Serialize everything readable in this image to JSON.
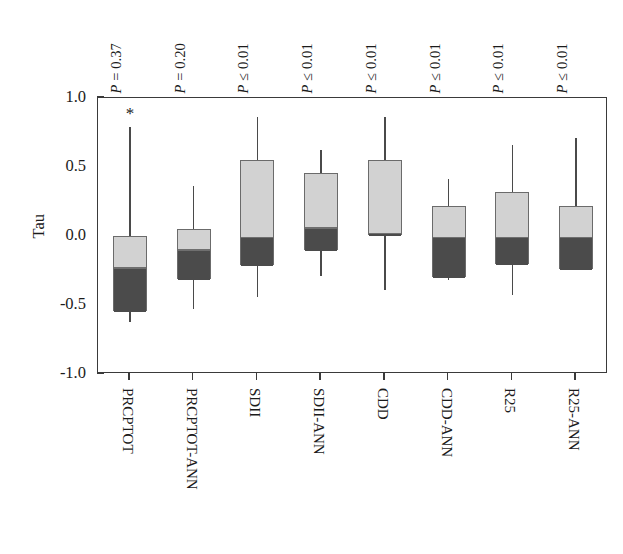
{
  "chart_data": {
    "type": "box",
    "title": "",
    "xlabel": "",
    "ylabel": "Tau",
    "ylim": [
      -1.0,
      1.0
    ],
    "yticks": [
      "1.0",
      "0.5",
      "0.0",
      "-0.5",
      "-1.0"
    ],
    "ytick_values": [
      1.0,
      0.5,
      0.0,
      -0.5,
      -1.0
    ],
    "grid": false,
    "legend": "none",
    "categories": [
      "PRCPTOT",
      "PRCPTOT-ANN",
      "SDII",
      "SDII-ANN",
      "CDD",
      "CDD-ANN",
      "R25",
      "R25-ANN"
    ],
    "annotations": {
      "p_values": [
        "P = 0.37",
        "P = 0.20",
        "P ≤ 0.01",
        "P ≤ 0.01",
        "P ≤ 0.01",
        "P ≤ 0.01",
        "P ≤ 0.01",
        "P ≤ 0.01"
      ],
      "outlier_marker": "*",
      "outlier_category": "PRCPTOT",
      "outlier_value": 0.89
    },
    "boxes": [
      {
        "category": "PRCPTOT",
        "whisker_low": -0.62,
        "q1": -0.54,
        "median": -0.22,
        "q3": 0.0,
        "whisker_high": 0.79
      },
      {
        "category": "PRCPTOT-ANN",
        "whisker_low": -0.53,
        "q1": -0.31,
        "median": -0.09,
        "q3": 0.05,
        "whisker_high": 0.36
      },
      {
        "category": "SDII",
        "whisker_low": -0.44,
        "q1": -0.21,
        "median": 0.0,
        "q3": 0.55,
        "whisker_high": 0.86
      },
      {
        "category": "SDII-ANN",
        "whisker_low": -0.29,
        "q1": -0.1,
        "median": 0.07,
        "q3": 0.46,
        "whisker_high": 0.62
      },
      {
        "category": "CDD",
        "whisker_low": -0.39,
        "q1": 0.01,
        "median": 0.03,
        "q3": 0.55,
        "whisker_high": 0.86
      },
      {
        "category": "CDD-ANN",
        "whisker_low": -0.32,
        "q1": -0.3,
        "median": 0.0,
        "q3": 0.22,
        "whisker_high": 0.41
      },
      {
        "category": "R25",
        "whisker_low": -0.43,
        "q1": -0.2,
        "median": 0.0,
        "q3": 0.32,
        "whisker_high": 0.66
      },
      {
        "category": "R25-ANN",
        "whisker_low": -0.17,
        "q1": -0.24,
        "median": 0.0,
        "q3": 0.22,
        "whisker_high": 0.71
      }
    ],
    "colors": {
      "box_upper": "#d2d2d2",
      "box_lower": "#4b4b4b",
      "box_border": "#6b6b6b",
      "axis": "#3a3a3a",
      "whisker": "#4a4a4a",
      "background": "#ffffff"
    }
  }
}
